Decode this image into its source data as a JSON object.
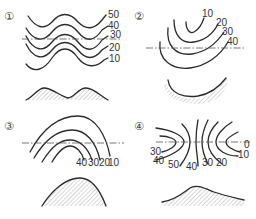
{
  "panels": [
    {
      "id": "1",
      "marker": "①",
      "contour_labels": [
        "50",
        "40",
        "30",
        "20",
        "10"
      ],
      "profile": "two-hill ridge profile"
    },
    {
      "id": "2",
      "marker": "②",
      "contour_labels": [
        "10",
        "20",
        "30",
        "40"
      ],
      "profile": "valley (concave) profile"
    },
    {
      "id": "3",
      "marker": "③",
      "contour_labels": [
        "40",
        "30",
        "20",
        "10"
      ],
      "profile": "single hill (convex) profile"
    },
    {
      "id": "4",
      "marker": "④",
      "contour_labels": [
        "30",
        "40",
        "50",
        "40",
        "30",
        "20",
        "10",
        "0"
      ],
      "profile": "asymmetric peak profile"
    }
  ]
}
